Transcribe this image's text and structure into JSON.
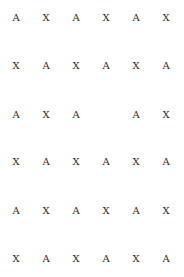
{
  "grid": {
    "rows": [
      [
        "A",
        "X",
        "A",
        "X",
        "A",
        "X"
      ],
      [
        "X",
        "A",
        "X",
        "A",
        "X",
        "A"
      ],
      [
        "A",
        "X",
        "A",
        "",
        "A",
        "X"
      ],
      [
        "X",
        "A",
        "X",
        "A",
        "X",
        "A"
      ],
      [
        "A",
        "X",
        "A",
        "X",
        "A",
        "X"
      ],
      [
        "X",
        "A",
        "X",
        "A",
        "X",
        "A"
      ]
    ],
    "col_x": [
      16,
      46,
      76,
      106,
      136,
      166
    ],
    "row_y": [
      18,
      66,
      115,
      162,
      211,
      259
    ]
  }
}
